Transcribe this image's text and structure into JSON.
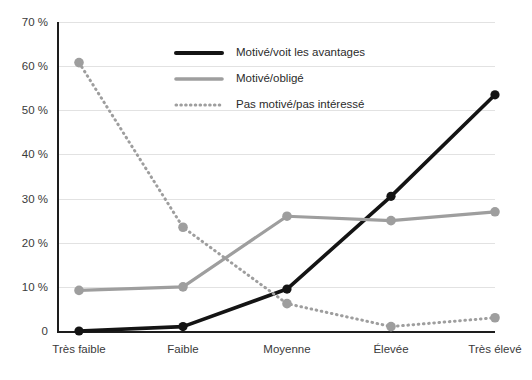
{
  "chart_data": {
    "type": "line",
    "title": "",
    "subtitle": "",
    "xlabel": "",
    "ylabel": "",
    "categories": [
      "Très faible",
      "Faible",
      "Moyenne",
      "Élevée",
      "Très élevé"
    ],
    "series": [
      {
        "name": "Motivé/voit les avantages",
        "values": [
          0,
          1,
          9.5,
          30.5,
          53.5
        ],
        "color": "#141414",
        "style": "solid",
        "markers": true
      },
      {
        "name": "Motivé/obligé",
        "values": [
          9.2,
          10,
          26,
          25,
          27
        ],
        "color": "#9e9e9e",
        "style": "solid",
        "markers": true
      },
      {
        "name": "Pas motivé/pas intéressé",
        "values": [
          60.8,
          23.5,
          6.2,
          1,
          3
        ],
        "color": "#9e9e9e",
        "style": "dotted",
        "markers": true
      }
    ],
    "ylim": [
      0,
      70
    ],
    "yticks": [
      0,
      10,
      20,
      30,
      40,
      50,
      60,
      70
    ],
    "ytick_labels": [
      "0",
      "10 %",
      "20 %",
      "30 %",
      "40 %",
      "50 %",
      "60 %",
      "70 %"
    ],
    "grid": true,
    "grid_axis": "y",
    "legend_position": "top-center",
    "background_color": "#ffffff",
    "grid_color": "#e2e2e2",
    "axis_color": "#1d1d1d"
  }
}
